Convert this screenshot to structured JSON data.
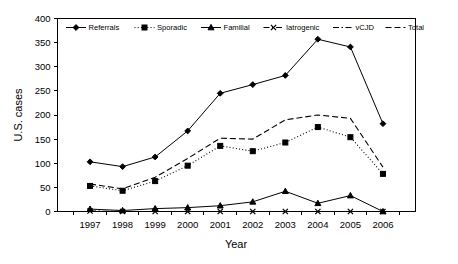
{
  "chart_data": {
    "type": "line",
    "title": "",
    "xlabel": "Year",
    "ylabel": "U.S. cases",
    "categories": [
      "1997",
      "1998",
      "1999",
      "2000",
      "2001",
      "2002",
      "2003",
      "2004",
      "2005",
      "2006"
    ],
    "x": [
      1997,
      1998,
      1999,
      2000,
      2001,
      2002,
      2003,
      2004,
      2005,
      2006
    ],
    "ylim": [
      0,
      400
    ],
    "yticks": [
      0,
      50,
      100,
      150,
      200,
      250,
      300,
      350,
      400
    ],
    "grid": false,
    "legend_position": "top-inside",
    "series": [
      {
        "name": "Referrals",
        "marker": "diamond",
        "line_style": "solid",
        "values": [
          103,
          93,
          113,
          167,
          245,
          263,
          282,
          357,
          341,
          182
        ]
      },
      {
        "name": "Sporadic",
        "marker": "square",
        "line_style": "dotted",
        "values": [
          53,
          43,
          63,
          95,
          136,
          125,
          143,
          175,
          154,
          78
        ]
      },
      {
        "name": "Familial",
        "marker": "triangle",
        "line_style": "solid",
        "values": [
          5,
          2,
          6,
          8,
          12,
          20,
          42,
          17,
          33,
          0
        ]
      },
      {
        "name": "Iatrogenic",
        "marker": "x",
        "line_style": "dashdot",
        "values": [
          1,
          0,
          0,
          0,
          0,
          0,
          0,
          0,
          0,
          0
        ]
      },
      {
        "name": "vCJD",
        "marker": "none",
        "line_style": "dashdot",
        "values": [
          0,
          0,
          0,
          0,
          0,
          0,
          0,
          0,
          0,
          0
        ]
      },
      {
        "name": "Total",
        "marker": "none",
        "line_style": "dashed",
        "values": [
          57,
          47,
          71,
          110,
          152,
          150,
          190,
          200,
          193,
          92
        ]
      }
    ]
  },
  "axes": {
    "y_tick_labels": [
      "400",
      "350",
      "300",
      "250",
      "200",
      "150",
      "100",
      "50",
      "0"
    ],
    "y_axis_title": "U.S. cases",
    "x_tick_labels": [
      "1997",
      "1998",
      "1999",
      "2000",
      "2001",
      "2002",
      "2003",
      "2004",
      "2005",
      "2006"
    ],
    "x_axis_title": "Year"
  },
  "legend": {
    "items": [
      {
        "label": "Referrals"
      },
      {
        "label": "Sporadic"
      },
      {
        "label": "Familial"
      },
      {
        "label": "Iatrogenic"
      },
      {
        "label": "vCJD"
      },
      {
        "label": "Total"
      }
    ]
  },
  "colors": {
    "ink": "#000000",
    "background": "#ffffff"
  }
}
